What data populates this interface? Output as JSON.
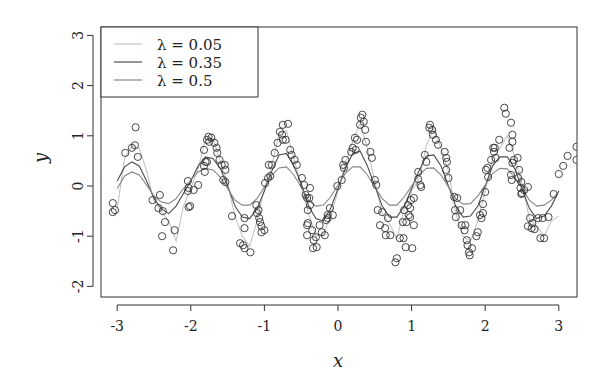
{
  "chart_data": {
    "type": "scatter",
    "title": "",
    "xlabel": "x",
    "ylabel": "y",
    "xlim": [
      -3.23,
      3.24
    ],
    "ylim": [
      -2.2,
      3.17
    ],
    "xticks": [
      -3,
      -2,
      -1,
      0,
      1,
      2,
      3
    ],
    "yticks": [
      -2,
      -1,
      0,
      1,
      2,
      3
    ],
    "xtick_labels": [
      "-3",
      "-2",
      "-1",
      "0",
      "1",
      "2",
      "3"
    ],
    "ytick_labels": [
      "-2",
      "-1",
      "0",
      "1",
      "2",
      "3"
    ],
    "grid": false,
    "legend_position": "top-left",
    "legend": [
      {
        "label": "λ = 0.05",
        "color": "#c4c4c4"
      },
      {
        "label": "λ = 0.35",
        "color": "#4d4d4d"
      },
      {
        "label": "λ = 0.5",
        "color": "#858585"
      }
    ],
    "points_px_note": "scatter points as [x, y] data values",
    "points": [
      [
        -3.06,
        -0.34
      ],
      [
        -3.03,
        -0.48
      ],
      [
        -3.06,
        -0.52
      ],
      [
        -2.89,
        0.66
      ],
      [
        -2.8,
        0.76
      ],
      [
        -2.75,
        1.17
      ],
      [
        -2.76,
        0.81
      ],
      [
        -2.72,
        0.58
      ],
      [
        -2.52,
        -0.28
      ],
      [
        -2.42,
        -0.18
      ],
      [
        -2.44,
        -0.44
      ],
      [
        -2.38,
        -0.5
      ],
      [
        -2.35,
        -0.72
      ],
      [
        -2.39,
        -1.0
      ],
      [
        -2.22,
        -0.88
      ],
      [
        -2.24,
        -1.28
      ],
      [
        -2.04,
        -0.1
      ],
      [
        -2.03,
        -0.04
      ],
      [
        -2.04,
        0.1
      ],
      [
        -2.03,
        -0.42
      ],
      [
        -2.01,
        -0.4
      ],
      [
        -1.96,
        -0.08
      ],
      [
        -1.9,
        0.02
      ],
      [
        -1.82,
        0.4
      ],
      [
        -1.78,
        0.48
      ],
      [
        -1.81,
        0.28
      ],
      [
        -1.82,
        0.72
      ],
      [
        -1.78,
        0.92
      ],
      [
        -1.76,
        0.98
      ],
      [
        -1.75,
        0.88
      ],
      [
        -1.72,
        0.96
      ],
      [
        -1.68,
        0.86
      ],
      [
        -1.65,
        0.76
      ],
      [
        -1.64,
        0.66
      ],
      [
        -1.8,
        0.48
      ],
      [
        -1.61,
        0.52
      ],
      [
        -1.58,
        0.42
      ],
      [
        -1.54,
        0.42
      ],
      [
        -1.53,
        0.32
      ],
      [
        -1.56,
        0.12
      ],
      [
        -1.53,
        0.08
      ],
      [
        -1.44,
        -0.6
      ],
      [
        -1.27,
        -0.64
      ],
      [
        -1.27,
        -0.84
      ],
      [
        -1.33,
        -1.14
      ],
      [
        -1.29,
        -1.18
      ],
      [
        -1.27,
        -1.24
      ],
      [
        -1.19,
        -1.32
      ],
      [
        -1.11,
        -0.38
      ],
      [
        -1.08,
        -0.48
      ],
      [
        -1.1,
        -0.54
      ],
      [
        -1.07,
        -0.64
      ],
      [
        -1.06,
        -0.72
      ],
      [
        -1.04,
        -0.8
      ],
      [
        -1.04,
        -0.92
      ],
      [
        -1.0,
        -0.88
      ],
      [
        -0.99,
        0.06
      ],
      [
        -0.95,
        0.16
      ],
      [
        -0.92,
        0.2
      ],
      [
        -0.94,
        0.42
      ],
      [
        -0.9,
        0.42
      ],
      [
        -0.86,
        0.66
      ],
      [
        -0.82,
        0.86
      ],
      [
        -0.79,
        1.08
      ],
      [
        -0.75,
        1.22
      ],
      [
        -0.68,
        1.24
      ],
      [
        -0.76,
        1.02
      ],
      [
        -0.75,
        0.92
      ],
      [
        -0.71,
        0.92
      ],
      [
        -0.65,
        0.72
      ],
      [
        -0.63,
        0.62
      ],
      [
        -0.59,
        0.52
      ],
      [
        -0.56,
        0.42
      ],
      [
        -0.49,
        0.16
      ],
      [
        -0.46,
        0.02
      ],
      [
        -0.44,
        -0.18
      ],
      [
        -0.42,
        -0.24
      ],
      [
        -0.41,
        -0.48
      ],
      [
        -0.42,
        -0.78
      ],
      [
        -0.42,
        -0.98
      ],
      [
        -0.38,
        -0.04
      ],
      [
        -0.39,
        -0.24
      ],
      [
        -0.38,
        -0.38
      ],
      [
        -0.41,
        -0.74
      ],
      [
        -0.35,
        -0.88
      ],
      [
        -0.33,
        -1.08
      ],
      [
        -0.34,
        -1.24
      ],
      [
        -0.3,
        -1.02
      ],
      [
        -0.29,
        -1.22
      ],
      [
        -0.25,
        -0.78
      ],
      [
        -0.22,
        -0.92
      ],
      [
        -0.18,
        -0.98
      ],
      [
        -0.16,
        -0.68
      ],
      [
        -0.14,
        -0.64
      ],
      [
        -0.14,
        -0.58
      ],
      [
        -0.11,
        -0.44
      ],
      [
        -0.07,
        -0.58
      ],
      [
        -0.01,
        0.0
      ],
      [
        0.05,
        0.12
      ],
      [
        0.07,
        0.42
      ],
      [
        0.1,
        0.52
      ],
      [
        0.08,
        0.36
      ],
      [
        0.18,
        0.68
      ],
      [
        0.2,
        0.76
      ],
      [
        0.23,
        0.96
      ],
      [
        0.26,
        0.92
      ],
      [
        0.24,
        0.72
      ],
      [
        0.3,
        1.22
      ],
      [
        0.31,
        1.36
      ],
      [
        0.33,
        1.42
      ],
      [
        0.35,
        1.28
      ],
      [
        0.37,
        1.12
      ],
      [
        0.38,
        0.88
      ],
      [
        0.44,
        0.68
      ],
      [
        0.46,
        0.56
      ],
      [
        0.5,
        0.12
      ],
      [
        0.52,
        0.02
      ],
      [
        0.54,
        -0.48
      ],
      [
        0.6,
        -0.52
      ],
      [
        0.57,
        -0.78
      ],
      [
        0.64,
        -0.84
      ],
      [
        0.68,
        -0.64
      ],
      [
        0.65,
        -0.98
      ],
      [
        0.71,
        -0.98
      ],
      [
        0.78,
        -1.52
      ],
      [
        0.8,
        -1.44
      ],
      [
        0.84,
        -1.04
      ],
      [
        0.9,
        -0.48
      ],
      [
        0.88,
        -0.72
      ],
      [
        0.95,
        -0.38
      ],
      [
        0.99,
        -0.28
      ],
      [
        0.98,
        -0.62
      ],
      [
        1.01,
        -1.24
      ],
      [
        1.03,
        -0.78
      ],
      [
        0.89,
        -1.04
      ],
      [
        0.92,
        -1.22
      ],
      [
        0.93,
        -0.72
      ],
      [
        0.96,
        -0.58
      ],
      [
        0.98,
        -0.44
      ],
      [
        1.03,
        -0.24
      ],
      [
        1.09,
        0.14
      ],
      [
        1.09,
        0.28
      ],
      [
        1.12,
        0.02
      ],
      [
        1.13,
        -0.02
      ],
      [
        1.18,
        0.62
      ],
      [
        1.2,
        0.48
      ],
      [
        1.24,
        1.16
      ],
      [
        1.25,
        1.22
      ],
      [
        1.28,
        1.12
      ],
      [
        1.29,
        1.02
      ],
      [
        1.33,
        0.92
      ],
      [
        1.36,
        0.82
      ],
      [
        1.45,
        0.68
      ],
      [
        1.47,
        0.56
      ],
      [
        1.48,
        0.48
      ],
      [
        1.47,
        0.32
      ],
      [
        1.5,
        0.16
      ],
      [
        1.58,
        -0.22
      ],
      [
        1.62,
        -0.24
      ],
      [
        1.59,
        -0.48
      ],
      [
        1.6,
        -0.62
      ],
      [
        1.66,
        -0.48
      ],
      [
        1.68,
        -0.78
      ],
      [
        1.72,
        -0.88
      ],
      [
        1.73,
        -0.78
      ],
      [
        1.75,
        -1.08
      ],
      [
        1.76,
        -1.18
      ],
      [
        1.78,
        -1.32
      ],
      [
        1.82,
        -1.24
      ],
      [
        1.79,
        -1.38
      ],
      [
        1.88,
        -1.0
      ],
      [
        1.9,
        -0.92
      ],
      [
        1.95,
        -0.64
      ],
      [
        1.97,
        -0.54
      ],
      [
        2.01,
        0.32
      ],
      [
        2.03,
        0.36
      ],
      [
        2.04,
        0.18
      ],
      [
        2.08,
        0.52
      ],
      [
        2.13,
        0.76
      ],
      [
        2.19,
        0.92
      ],
      [
        1.93,
        -0.58
      ],
      [
        1.97,
        -0.36
      ],
      [
        2.0,
        -0.12
      ],
      [
        2.11,
        0.76
      ],
      [
        2.12,
        0.68
      ],
      [
        2.14,
        0.56
      ],
      [
        2.26,
        1.56
      ],
      [
        2.28,
        1.44
      ],
      [
        2.35,
        1.26
      ],
      [
        2.37,
        1.02
      ],
      [
        2.37,
        0.88
      ],
      [
        2.33,
        0.76
      ],
      [
        2.37,
        0.46
      ],
      [
        2.35,
        0.22
      ],
      [
        2.39,
        0.52
      ],
      [
        2.44,
        0.56
      ],
      [
        2.46,
        0.32
      ],
      [
        2.36,
        0.12
      ],
      [
        2.45,
        0.16
      ],
      [
        2.49,
        0.08
      ],
      [
        2.48,
        -0.04
      ],
      [
        2.5,
        -0.14
      ],
      [
        2.53,
        -0.08
      ],
      [
        2.58,
        -0.02
      ],
      [
        2.49,
        -0.16
      ],
      [
        2.61,
        -0.64
      ],
      [
        2.58,
        -0.8
      ],
      [
        2.64,
        -0.74
      ],
      [
        2.63,
        -0.84
      ],
      [
        2.67,
        -0.86
      ],
      [
        2.72,
        -0.64
      ],
      [
        2.78,
        -0.64
      ],
      [
        2.75,
        -1.04
      ],
      [
        2.8,
        -1.04
      ],
      [
        2.86,
        -0.62
      ],
      [
        2.93,
        -0.16
      ],
      [
        3.0,
        0.24
      ],
      [
        3.06,
        0.4
      ],
      [
        3.12,
        0.6
      ],
      [
        3.24,
        0.78
      ],
      [
        3.24,
        0.52
      ]
    ],
    "series": [
      {
        "name": "λ = 0.05",
        "color": "#c4c4c4",
        "x": [
          -3.0,
          -2.9,
          -2.8,
          -2.7,
          -2.6,
          -2.5,
          -2.4,
          -2.3,
          -2.2,
          -2.1,
          -2.0,
          -1.9,
          -1.8,
          -1.7,
          -1.6,
          -1.5,
          -1.4,
          -1.3,
          -1.2,
          -1.1,
          -1.0,
          -0.9,
          -0.8,
          -0.7,
          -0.6,
          -0.5,
          -0.4,
          -0.3,
          -0.2,
          -0.1,
          0.0,
          0.1,
          0.2,
          0.3,
          0.4,
          0.5,
          0.6,
          0.7,
          0.8,
          0.9,
          1.0,
          1.1,
          1.2,
          1.3,
          1.4,
          1.5,
          1.6,
          1.7,
          1.8,
          1.9,
          2.0,
          2.1,
          2.2,
          2.3,
          2.4,
          2.5,
          2.6,
          2.7,
          2.8,
          2.9,
          3.0
        ],
        "y": [
          -0.45,
          0.55,
          0.8,
          0.75,
          0.3,
          -0.3,
          -0.5,
          -0.7,
          -1.1,
          -0.4,
          -0.05,
          0.35,
          0.92,
          0.95,
          0.5,
          0.05,
          -0.6,
          -1.0,
          -1.2,
          -0.7,
          -0.05,
          0.4,
          1.05,
          1.1,
          0.55,
          0.0,
          -0.55,
          -1.0,
          -0.95,
          -0.6,
          -0.1,
          0.45,
          0.9,
          1.25,
          0.75,
          0.1,
          -0.55,
          -0.75,
          -1.05,
          -0.45,
          -0.1,
          0.15,
          0.8,
          1.15,
          0.75,
          0.3,
          -0.55,
          -1.0,
          -1.1,
          -0.7,
          -0.1,
          0.55,
          0.75,
          1.0,
          0.6,
          0.05,
          -0.65,
          -0.8,
          -1.0,
          -0.7,
          -0.6
        ]
      },
      {
        "name": "λ = 0.35",
        "color": "#4d4d4d",
        "x": [
          -3.0,
          -2.9,
          -2.8,
          -2.7,
          -2.6,
          -2.5,
          -2.4,
          -2.3,
          -2.2,
          -2.1,
          -2.0,
          -1.9,
          -1.8,
          -1.7,
          -1.6,
          -1.5,
          -1.4,
          -1.3,
          -1.2,
          -1.1,
          -1.0,
          -0.9,
          -0.8,
          -0.7,
          -0.6,
          -0.5,
          -0.4,
          -0.3,
          -0.2,
          -0.1,
          0.0,
          0.1,
          0.2,
          0.3,
          0.4,
          0.5,
          0.6,
          0.7,
          0.8,
          0.9,
          1.0,
          1.1,
          1.2,
          1.3,
          1.4,
          1.5,
          1.6,
          1.7,
          1.8,
          1.9,
          2.0,
          2.1,
          2.2,
          2.3,
          2.4,
          2.5,
          2.6,
          2.7,
          2.8,
          2.9,
          3.0
        ],
        "y": [
          0.1,
          0.38,
          0.48,
          0.4,
          0.1,
          -0.25,
          -0.45,
          -0.55,
          -0.4,
          -0.15,
          0.1,
          0.4,
          0.58,
          0.55,
          0.35,
          0.0,
          -0.4,
          -0.62,
          -0.65,
          -0.45,
          -0.1,
          0.3,
          0.62,
          0.65,
          0.4,
          0.05,
          -0.4,
          -0.65,
          -0.7,
          -0.45,
          -0.05,
          0.35,
          0.65,
          0.7,
          0.4,
          0.0,
          -0.4,
          -0.62,
          -0.62,
          -0.4,
          -0.05,
          0.3,
          0.6,
          0.62,
          0.4,
          0.0,
          -0.4,
          -0.62,
          -0.6,
          -0.4,
          0.0,
          0.4,
          0.58,
          0.58,
          0.35,
          -0.05,
          -0.45,
          -0.65,
          -0.6,
          -0.4,
          -0.1
        ]
      },
      {
        "name": "λ = 0.5",
        "color": "#858585",
        "x": [
          -3.0,
          -2.9,
          -2.8,
          -2.7,
          -2.6,
          -2.5,
          -2.4,
          -2.3,
          -2.2,
          -2.1,
          -2.0,
          -1.9,
          -1.8,
          -1.7,
          -1.6,
          -1.5,
          -1.4,
          -1.3,
          -1.2,
          -1.1,
          -1.0,
          -0.9,
          -0.8,
          -0.7,
          -0.6,
          -0.5,
          -0.4,
          -0.3,
          -0.2,
          -0.1,
          0.0,
          0.1,
          0.2,
          0.3,
          0.4,
          0.5,
          0.6,
          0.7,
          0.8,
          0.9,
          1.0,
          1.1,
          1.2,
          1.3,
          1.4,
          1.5,
          1.6,
          1.7,
          1.8,
          1.9,
          2.0,
          2.1,
          2.2,
          2.3,
          2.4,
          2.5,
          2.6,
          2.7,
          2.8,
          2.9,
          3.0
        ],
        "y": [
          -0.05,
          0.2,
          0.28,
          0.22,
          0.02,
          -0.2,
          -0.32,
          -0.35,
          -0.25,
          -0.05,
          0.12,
          0.28,
          0.35,
          0.32,
          0.18,
          -0.05,
          -0.28,
          -0.38,
          -0.38,
          -0.25,
          -0.02,
          0.22,
          0.36,
          0.38,
          0.22,
          -0.02,
          -0.28,
          -0.4,
          -0.38,
          -0.22,
          0.02,
          0.25,
          0.38,
          0.38,
          0.22,
          -0.02,
          -0.25,
          -0.38,
          -0.38,
          -0.22,
          0.0,
          0.22,
          0.35,
          0.36,
          0.22,
          -0.02,
          -0.25,
          -0.36,
          -0.35,
          -0.2,
          0.02,
          0.25,
          0.35,
          0.34,
          0.18,
          -0.05,
          -0.28,
          -0.4,
          -0.38,
          -0.28,
          -0.12
        ]
      }
    ]
  },
  "axes": {
    "xlabel": "x",
    "ylabel": "y"
  },
  "legend": {
    "items": [
      {
        "label": "λ = 0.05"
      },
      {
        "label": "λ = 0.35"
      },
      {
        "label": "λ = 0.5"
      }
    ]
  }
}
